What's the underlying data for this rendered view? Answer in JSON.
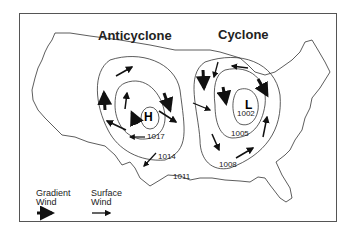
{
  "titles": {
    "anticyclone": "Anticyclone",
    "cyclone": "Cyclone"
  },
  "centers": {
    "high": "H",
    "low": "L"
  },
  "isobars": {
    "anticyclone": [
      "1017",
      "1014",
      "1011"
    ],
    "cyclone": [
      "1002",
      "1005",
      "1008"
    ]
  },
  "legend": {
    "gradient_wind_line1": "Gradient",
    "gradient_wind_line2": "Wind",
    "surface_wind_line1": "Surface",
    "surface_wind_line2": "Wind"
  }
}
